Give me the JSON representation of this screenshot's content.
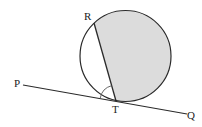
{
  "diagram": {
    "type": "geometry-circle-tangent",
    "colors": {
      "stroke": "#2a2a2a",
      "shade": "#dcdcdc",
      "background": "#ffffff"
    },
    "circle": {
      "cx": 125.5,
      "cy": 56,
      "r": 45.5
    },
    "points": {
      "R": {
        "label": "R",
        "x": 94,
        "y": 23
      },
      "T": {
        "label": "T",
        "x": 116,
        "y": 101
      },
      "P": {
        "label": "P",
        "x": 23,
        "y": 85
      },
      "Q": {
        "label": "Q",
        "x": 187,
        "y": 114
      }
    },
    "labels": {
      "R": "R",
      "T": "T",
      "P": "P",
      "Q": "Q"
    },
    "chord": "RT",
    "tangent_line": "PQ",
    "shaded_region": "major segment right of chord RT",
    "marked_angle": "angle PTR"
  }
}
